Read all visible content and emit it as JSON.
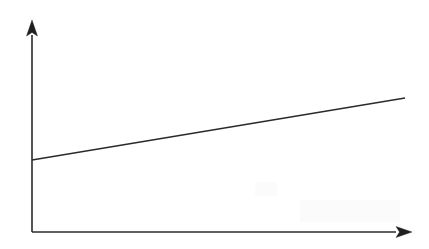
{
  "figure": {
    "kind": "line-graph",
    "background_color": "#ffffff",
    "stroke_color": "#2b2b2b",
    "arrow_color": "#1f1f1f",
    "width": 429,
    "height": 249,
    "title": "",
    "has_labels": false,
    "has_ticks": false,
    "has_gridlines": false,
    "has_legend": false
  },
  "axes": {
    "origin": {
      "x": 32,
      "y": 232
    },
    "y_axis": {
      "name": "y-axis",
      "label": "",
      "x": 32,
      "y_bottom": 232,
      "y_top": 35,
      "arrow": {
        "name": "y-axis-arrowhead",
        "direction": "up",
        "tip_x": 32,
        "tip_y": 20,
        "base_y": 36,
        "half_width": 5.5
      }
    },
    "x_axis": {
      "name": "x-axis",
      "label": "",
      "y": 232,
      "x_left": 32,
      "x_right": 396,
      "arrow": {
        "name": "x-axis-arrowhead",
        "direction": "right",
        "tip_x": 412,
        "tip_y": 232,
        "base_x": 396,
        "half_height": 5.5
      }
    }
  },
  "chart_data": {
    "type": "line",
    "title": "",
    "subtitle": "",
    "xlabel": "",
    "ylabel": "",
    "grid": false,
    "legend": null,
    "legend_position": "none",
    "annotations": [],
    "xticks": [],
    "yticks": [],
    "xticklabels": [],
    "yticklabels": [],
    "xlim": [
      0,
      1
    ],
    "ylim": [
      0,
      1
    ],
    "series": [
      {
        "name": "trend",
        "kind": "straight-line",
        "color": "#2b2b2b",
        "linewidth": 1.7,
        "x": [
          0,
          1
        ],
        "y": [
          0.365,
          0.68
        ],
        "pixel_points": [
          {
            "x": 32,
            "y": 160
          },
          {
            "x": 405,
            "y": 98
          }
        ],
        "description": "gently rising straight line from the y-axis to the upper right"
      }
    ]
  },
  "artifacts": [
    {
      "name": "scan-smudge-lower-right",
      "x": 300,
      "y": 200,
      "width": 100,
      "height": 22,
      "color": "#fbfbfb"
    },
    {
      "name": "scan-smudge-mid-right",
      "x": 255,
      "y": 182,
      "width": 22,
      "height": 14,
      "color": "#fcfcfc"
    }
  ]
}
